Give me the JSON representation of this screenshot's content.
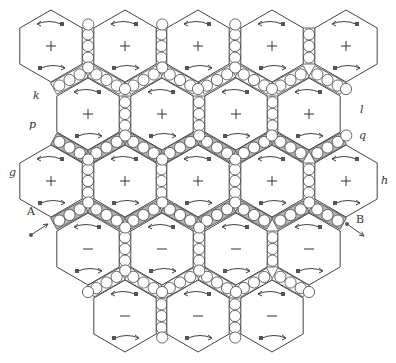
{
  "diagram": {
    "width": 396,
    "height": 363,
    "hex_radius": 36,
    "colors": {
      "stroke": "#444444",
      "channel_shade": "#b8b8b8",
      "bead_fill": "#ffffff",
      "arrow": "#444444"
    },
    "rows": [
      {
        "y": 46,
        "xs": [
          51,
          125,
          198,
          272,
          346
        ],
        "sign": "+"
      },
      {
        "y": 114,
        "xs": [
          88,
          162,
          236,
          309
        ],
        "sign": "+"
      },
      {
        "y": 181,
        "xs": [
          51,
          125,
          198,
          272,
          346
        ],
        "sign": "+"
      },
      {
        "y": 249,
        "xs": [
          88,
          162,
          236,
          309
        ],
        "sign": "−"
      },
      {
        "y": 316,
        "xs": [
          125,
          198,
          272
        ],
        "sign": "−"
      }
    ],
    "shaded_channel_rows": [
      [
        1,
        2
      ],
      [
        2,
        3
      ]
    ],
    "labels": [
      {
        "id": "k",
        "text": "k",
        "x": 33,
        "y": 98,
        "italic": true
      },
      {
        "id": "p",
        "text": "p",
        "x": 29,
        "y": 127,
        "italic": true
      },
      {
        "id": "g",
        "text": "g",
        "x": 9,
        "y": 175,
        "italic": true
      },
      {
        "id": "l",
        "text": "l",
        "x": 360,
        "y": 112,
        "italic": true
      },
      {
        "id": "q",
        "text": "q",
        "x": 359,
        "y": 138,
        "italic": true
      },
      {
        "id": "h",
        "text": "h",
        "x": 381,
        "y": 183,
        "italic": true
      },
      {
        "id": "A",
        "text": "A",
        "x": 27,
        "y": 214,
        "italic": false
      },
      {
        "id": "B",
        "text": "B",
        "x": 356,
        "y": 222,
        "italic": false
      }
    ],
    "vectors": [
      {
        "id": "A-arrow",
        "x1": 31,
        "y1": 235,
        "x2": 48,
        "y2": 224
      },
      {
        "id": "B-arrow",
        "x1": 347,
        "y1": 224,
        "x2": 364,
        "y2": 236
      }
    ]
  }
}
